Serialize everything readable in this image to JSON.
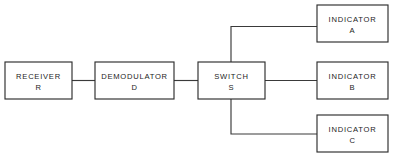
{
  "diagram": {
    "type": "block-diagram",
    "title": "",
    "background_color": "#ffffff",
    "line_color": "#3a3a3a",
    "text_color": "#1c1c1c",
    "blocks": [
      {
        "id": "receiver",
        "label": "RECEIVER",
        "sublabel": "R",
        "x": 5,
        "y": 62,
        "width": 67,
        "height": 37
      },
      {
        "id": "demodulator",
        "label": "DEMODULATOR",
        "sublabel": "D",
        "x": 95,
        "y": 62,
        "width": 79,
        "height": 37
      },
      {
        "id": "switch",
        "label": "SWITCH",
        "sublabel": "S",
        "x": 198,
        "y": 62,
        "width": 67,
        "height": 37
      },
      {
        "id": "indicator-a",
        "label": "INDICATOR",
        "sublabel": "A",
        "x": 317,
        "y": 5,
        "width": 71,
        "height": 37
      },
      {
        "id": "indicator-b",
        "label": "INDICATOR",
        "sublabel": "B",
        "x": 317,
        "y": 62,
        "width": 71,
        "height": 37
      },
      {
        "id": "indicator-c",
        "label": "INDICATOR",
        "sublabel": "C",
        "x": 317,
        "y": 115,
        "width": 71,
        "height": 37
      }
    ],
    "connectors": [
      {
        "id": "receiver-to-demodulator",
        "from": "receiver",
        "to": "demodulator",
        "path": "M 72 80.5 L 95 80.5"
      },
      {
        "id": "demodulator-to-switch",
        "from": "demodulator",
        "to": "switch",
        "path": "M 174 80.5 L 198 80.5"
      },
      {
        "id": "switch-to-indicator-a",
        "from": "switch",
        "to": "indicator-a",
        "path": "M 231 62 L 231 26.5 L 317 26.5"
      },
      {
        "id": "switch-to-indicator-b",
        "from": "switch",
        "to": "indicator-b",
        "path": "M 265 80.5 L 317 80.5"
      },
      {
        "id": "switch-to-indicator-c",
        "from": "switch",
        "to": "indicator-c",
        "path": "M 231 99 L 231 134 L 317 134"
      }
    ]
  }
}
